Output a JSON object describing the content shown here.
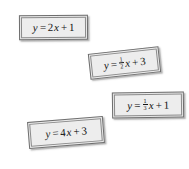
{
  "page": {
    "background_color": "#ffffff",
    "card_fill_color": "#ededed",
    "card_border_color": "#6e6e6e",
    "text_color": "#141414"
  },
  "cards": [
    {
      "id": "card-1",
      "name": "equation-card-1",
      "equation_text": "y = 2x + 1",
      "parts": {
        "lhs": "y",
        "equals": "=",
        "slope": "2",
        "slope_is_fraction": false,
        "variable": "x",
        "plus": "+",
        "intercept": "1"
      }
    },
    {
      "id": "card-2",
      "name": "equation-card-2",
      "equation_text": "y = 1/2 x + 3",
      "parts": {
        "lhs": "y",
        "equals": "=",
        "slope_numerator": "1",
        "slope_denominator": "2",
        "slope_is_fraction": true,
        "variable": "x",
        "plus": "+",
        "intercept": "3"
      }
    },
    {
      "id": "card-3",
      "name": "equation-card-3",
      "equation_text": "y = 1/3 x + 1",
      "parts": {
        "lhs": "y",
        "equals": "=",
        "slope_numerator": "1",
        "slope_denominator": "3",
        "slope_is_fraction": true,
        "variable": "x",
        "plus": "+",
        "intercept": "1"
      }
    },
    {
      "id": "card-4",
      "name": "equation-card-4",
      "equation_text": "y = 4x + 3",
      "parts": {
        "lhs": "y",
        "equals": "=",
        "slope": "4",
        "slope_is_fraction": false,
        "variable": "x",
        "plus": "+",
        "intercept": "3"
      }
    }
  ]
}
